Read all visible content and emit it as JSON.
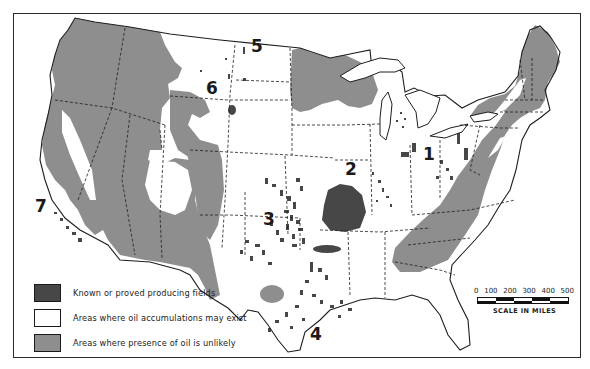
{
  "map": {
    "subject": "Oil-bearing areas of the conterminous United States",
    "colors": {
      "producing": "#474747",
      "may_exist": "#ffffff",
      "unlikely": "#8e8e8e",
      "outline": "#1e1e1e",
      "frame": "#2a2a2a"
    },
    "region_labels": [
      {
        "id": "1",
        "label": "1",
        "x": 423,
        "y": 160
      },
      {
        "id": "2",
        "label": "2",
        "x": 345,
        "y": 175
      },
      {
        "id": "3",
        "label": "3",
        "x": 263,
        "y": 225
      },
      {
        "id": "4",
        "label": "4",
        "x": 310,
        "y": 340
      },
      {
        "id": "5",
        "label": "5",
        "x": 251,
        "y": 52
      },
      {
        "id": "6",
        "label": "6",
        "x": 206,
        "y": 94
      },
      {
        "id": "7",
        "label": "7",
        "x": 35,
        "y": 212
      }
    ]
  },
  "legend": {
    "items": [
      {
        "key": "producing",
        "label": "Known or proved producing fields",
        "color": "#474747"
      },
      {
        "key": "may_exist",
        "label": "Areas where oil accumulations may exist",
        "color": "#ffffff"
      },
      {
        "key": "unlikely",
        "label": "Areas where presence of oil is unlikely",
        "color": "#8e8e8e"
      }
    ]
  },
  "scale": {
    "ticks": [
      "0",
      "100",
      "200",
      "300",
      "400",
      "500"
    ],
    "caption": "SCALE IN MILES",
    "units": "miles"
  }
}
